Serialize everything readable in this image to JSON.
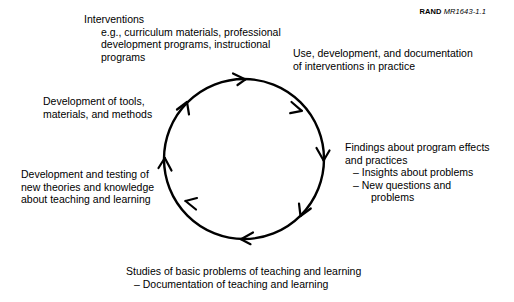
{
  "figure": {
    "credit": {
      "brand": "RAND",
      "code": "MR1643-1.1"
    },
    "cycle": {
      "direction": "clockwise",
      "shape": "circle",
      "arrow_count": 8,
      "stroke_color": "#000000",
      "center_x": 244,
      "center_y": 159,
      "radius": 80
    },
    "nodes": [
      {
        "id": "interventions",
        "heading": "Interventions",
        "detail_lines": [
          "e.g., curriculum materials, professional",
          "development programs, instructional",
          "programs"
        ]
      },
      {
        "id": "use-development",
        "lines": [
          "Use, development, and documentation",
          "of interventions in practice"
        ]
      },
      {
        "id": "findings",
        "lines": [
          "Findings about program effects",
          "and practices"
        ],
        "bullets": [
          "– Insights about problems",
          "– New questions and"
        ],
        "bullet_continuation": "problems"
      },
      {
        "id": "studies",
        "lines": [
          "Studies of basic problems of teaching and learning"
        ],
        "bullets": [
          "– Documentation of teaching and learning"
        ]
      },
      {
        "id": "development-testing",
        "lines": [
          "Development and testing of",
          "new theories and knowledge",
          "about teaching and learning"
        ]
      },
      {
        "id": "development-tools",
        "lines": [
          "Development of tools,",
          "materials, and methods"
        ]
      }
    ]
  }
}
